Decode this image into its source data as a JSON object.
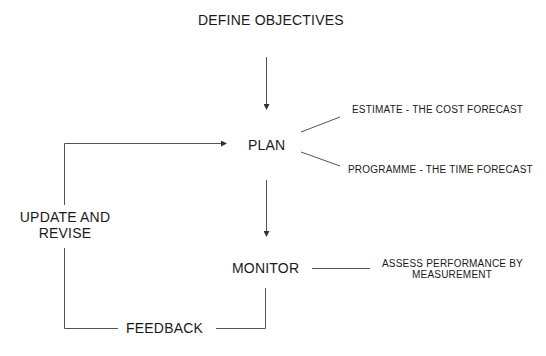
{
  "diagram": {
    "type": "flowchart",
    "nodes": {
      "define_objectives": "DEFINE OBJECTIVES",
      "plan": "PLAN",
      "monitor": "MONITOR",
      "update_revise_line1": "UPDATE AND",
      "update_revise_line2": "REVISE",
      "feedback": "FEEDBACK"
    },
    "annotations": {
      "estimate": "ESTIMATE - THE COST FORECAST",
      "programme": "PROGRAMME - THE TIME FORECAST",
      "assess_line1": "ASSESS PERFORMANCE BY",
      "assess_line2": "MEASUREMENT"
    },
    "edges": [
      {
        "from": "DEFINE OBJECTIVES",
        "to": "PLAN",
        "arrow": true
      },
      {
        "from": "PLAN",
        "to": "MONITOR",
        "arrow": true
      },
      {
        "from": "MONITOR",
        "to": "FEEDBACK",
        "arrow": false
      },
      {
        "from": "FEEDBACK",
        "to": "UPDATE AND REVISE",
        "arrow": false
      },
      {
        "from": "UPDATE AND REVISE",
        "to": "PLAN",
        "arrow": true
      },
      {
        "from": "PLAN",
        "to": "ESTIMATE - THE COST FORECAST",
        "arrow": false
      },
      {
        "from": "PLAN",
        "to": "PROGRAMME - THE TIME FORECAST",
        "arrow": false
      },
      {
        "from": "MONITOR",
        "to": "ASSESS PERFORMANCE BY MEASUREMENT",
        "arrow": false
      }
    ],
    "line_color": "#444444",
    "text_color": "#1a1a1a"
  }
}
